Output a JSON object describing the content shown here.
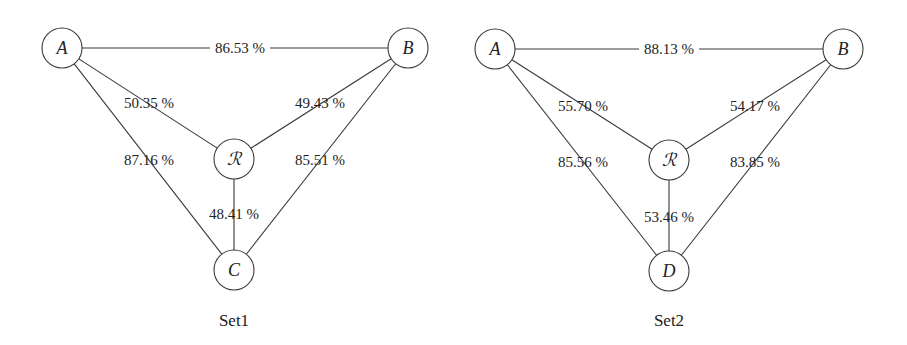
{
  "diagrams": [
    {
      "caption": "Set1",
      "caption_pos": {
        "x": 234,
        "y": 326
      },
      "nodes": [
        {
          "id": "A",
          "label": "A",
          "x": 62,
          "y": 48
        },
        {
          "id": "B",
          "label": "B",
          "x": 408,
          "y": 48
        },
        {
          "id": "R",
          "label": "ℛ",
          "x": 234,
          "y": 159
        },
        {
          "id": "C",
          "label": "C",
          "x": 234,
          "y": 270
        }
      ],
      "edges": [
        {
          "from": "A",
          "to": "B",
          "label": "86.53 %",
          "lx": 240,
          "ly": 53
        },
        {
          "from": "A",
          "to": "R",
          "label": "50.35 %",
          "lx": 149,
          "ly": 108
        },
        {
          "from": "B",
          "to": "R",
          "label": "49.43 %",
          "lx": 320,
          "ly": 108
        },
        {
          "from": "A",
          "to": "C",
          "label": "87.16 %",
          "lx": 149,
          "ly": 165
        },
        {
          "from": "B",
          "to": "C",
          "label": "85.51 %",
          "lx": 320,
          "ly": 165
        },
        {
          "from": "R",
          "to": "C",
          "label": "48.41 %",
          "lx": 234,
          "ly": 219
        }
      ]
    },
    {
      "caption": "Set2",
      "caption_pos": {
        "x": 669,
        "y": 326
      },
      "nodes": [
        {
          "id": "A",
          "label": "A",
          "x": 495,
          "y": 49
        },
        {
          "id": "B",
          "label": "B",
          "x": 843,
          "y": 49
        },
        {
          "id": "R",
          "label": "ℛ",
          "x": 669,
          "y": 160
        },
        {
          "id": "D",
          "label": "D",
          "x": 669,
          "y": 271
        }
      ],
      "edges": [
        {
          "from": "A",
          "to": "B",
          "label": "88.13 %",
          "lx": 669,
          "ly": 54
        },
        {
          "from": "A",
          "to": "R",
          "label": "55.70 %",
          "lx": 583,
          "ly": 111
        },
        {
          "from": "B",
          "to": "R",
          "label": "54.17 %",
          "lx": 755,
          "ly": 111
        },
        {
          "from": "A",
          "to": "D",
          "label": "85.56 %",
          "lx": 583,
          "ly": 167
        },
        {
          "from": "B",
          "to": "D",
          "label": "83.85 %",
          "lx": 755,
          "ly": 167
        },
        {
          "from": "R",
          "to": "D",
          "label": "53.46 %",
          "lx": 669,
          "ly": 222
        }
      ]
    }
  ],
  "style": {
    "node_radius": 20,
    "stroke_color": "#3a3a3a",
    "text_color": "#222222",
    "background": "#ffffff"
  }
}
